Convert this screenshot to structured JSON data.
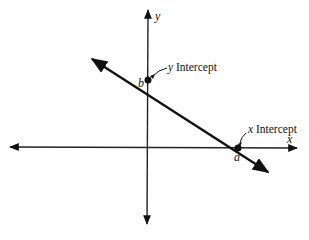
{
  "diagram": {
    "type": "coordinate-plane-line",
    "axes": {
      "x_label": "x",
      "y_label": "y"
    },
    "points": {
      "y_intercept": {
        "marker_label": "b",
        "callout": {
          "var": "y",
          "text": "Intercept"
        }
      },
      "x_intercept": {
        "marker_label": "a",
        "callout": {
          "var": "x",
          "text": "Intercept"
        }
      }
    },
    "colors": {
      "stroke": "#111111",
      "background": "#ffffff"
    }
  }
}
